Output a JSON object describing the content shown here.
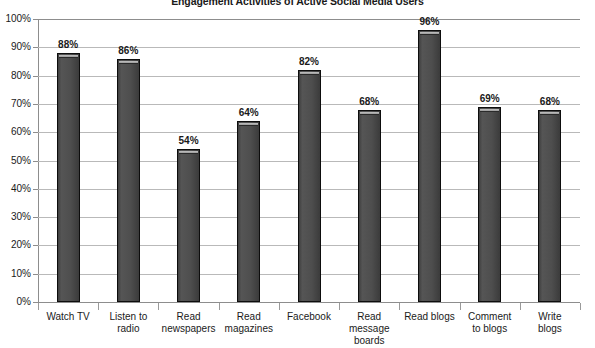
{
  "chart_data": {
    "type": "bar",
    "title": "Engagement Activities of Active Social Media Users",
    "xlabel": "",
    "ylabel": "",
    "ylim": [
      0,
      100
    ],
    "grid": true,
    "legend": "none",
    "value_suffix": "%",
    "categories": [
      "Watch TV",
      "Listen to radio",
      "Read newspapers",
      "Read magazines",
      "Facebook",
      "Read message boards",
      "Read blogs",
      "Comment to blogs",
      "Write blogs"
    ],
    "category_lines": [
      [
        "Watch TV"
      ],
      [
        "Listen to",
        "radio"
      ],
      [
        "Read",
        "newspapers"
      ],
      [
        "Read",
        "magazines"
      ],
      [
        "Facebook"
      ],
      [
        "Read",
        "message",
        "boards"
      ],
      [
        "Read blogs"
      ],
      [
        "Comment",
        "to blogs"
      ],
      [
        "Write",
        "blogs"
      ]
    ],
    "values": [
      88,
      86,
      54,
      64,
      82,
      68,
      96,
      69,
      68
    ],
    "value_labels": [
      "88%",
      "86%",
      "54%",
      "64%",
      "82%",
      "68%",
      "96%",
      "69%",
      "68%"
    ],
    "ytick_values": [
      0,
      10,
      20,
      30,
      40,
      50,
      60,
      70,
      80,
      90,
      100
    ],
    "ytick_labels": [
      "0%",
      "10%",
      "20%",
      "30%",
      "40%",
      "50%",
      "60%",
      "70%",
      "80%",
      "90%",
      "100%"
    ],
    "colors": {
      "bar_fill": "#4b4b4b",
      "bar_outline": "#0d0d0d",
      "bar_cap": "#a8a8a8",
      "gridline": "#b9b9b9",
      "axis": "#8d8d8d",
      "text": "#1a1a1a",
      "background": "#ffffff"
    }
  }
}
